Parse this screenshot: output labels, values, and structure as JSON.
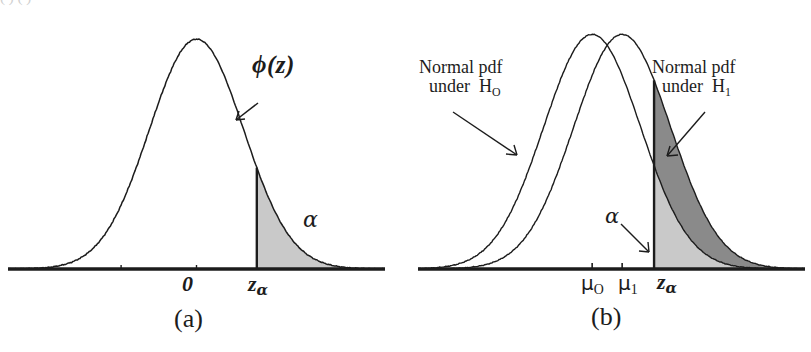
{
  "figure": {
    "background_color": "#ffffff",
    "ink_color": "#1c1c1c",
    "shade_light": "#c9c9c9",
    "shade_dark": "#8a8a8a"
  },
  "panel_a": {
    "caption": "(a)",
    "curve_label": "ϕ(z)",
    "alpha_label": "α",
    "axis_ticks": [
      {
        "label": "0"
      },
      {
        "label": "z",
        "subscript": "α"
      }
    ],
    "tick_zero_label": "0",
    "tick_zalpha_base": "z",
    "tick_zalpha_sub": "α"
  },
  "panel_b": {
    "caption": "(b)",
    "label_h0_line1": "Normal pdf",
    "label_h0_line2": "under",
    "label_h0_hyp": "H",
    "label_h0_sub": "O",
    "label_h1_line1": "Normal pdf",
    "label_h1_line2": "under",
    "label_h1_hyp": "H",
    "label_h1_sub": "1",
    "alpha_label": "α",
    "tick_mu0_base": "μ",
    "tick_mu0_sub": "O",
    "tick_mu1_base": "μ",
    "tick_mu1_sub": "1",
    "tick_zalpha_base": "z",
    "tick_zalpha_sub": "α"
  },
  "top_crop_artifact": "( )   (     )",
  "chart_data": {
    "type": "line",
    "xlabel": "",
    "ylabel": "",
    "grid": false,
    "legend": "none",
    "panels": [
      {
        "id": "a",
        "caption": "(a)",
        "series": [
          {
            "name": "phi(z)",
            "distribution": "normal",
            "mean": 0,
            "sd": 1,
            "label": "ϕ(z)",
            "fill": "none"
          }
        ],
        "markers": [
          {
            "name": "0",
            "x": 0
          },
          {
            "name": "z_alpha",
            "x": 1.28
          }
        ],
        "shaded_regions": [
          {
            "name": "alpha",
            "label": "α",
            "from_x": 1.28,
            "to_x": 4.0,
            "series": "phi(z)",
            "color": "#c9c9c9"
          }
        ],
        "xlim": [
          -4.0,
          4.0
        ],
        "ylim": [
          0,
          0.42
        ]
      },
      {
        "id": "b",
        "caption": "(b)",
        "series": [
          {
            "name": "H0",
            "distribution": "normal",
            "mean": 0,
            "sd": 1,
            "label": "Normal pdf under H₀",
            "fill": "none"
          },
          {
            "name": "H1",
            "distribution": "normal",
            "mean": 0.62,
            "sd": 1,
            "label": "Normal pdf under H₁",
            "fill": "none"
          }
        ],
        "markers": [
          {
            "name": "mu_0",
            "x": 0
          },
          {
            "name": "mu_1",
            "x": 0.62
          },
          {
            "name": "z_alpha",
            "x": 1.28
          }
        ],
        "shaded_regions": [
          {
            "name": "alpha",
            "label": "α",
            "from_x": 1.28,
            "to_x": 4.0,
            "series": "H0",
            "color": "#c9c9c9"
          },
          {
            "name": "power",
            "label": "",
            "from_x": 1.28,
            "to_x": 4.0,
            "series": "H1",
            "color": "#8a8a8a"
          }
        ],
        "xlim": [
          -3.6,
          4.4
        ],
        "ylim": [
          0,
          0.42
        ]
      }
    ]
  }
}
